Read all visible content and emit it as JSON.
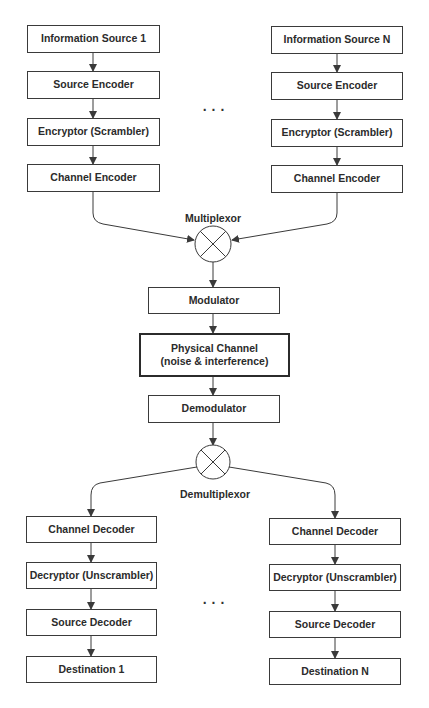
{
  "diagram": {
    "transmitter_left": [
      "Information Source 1",
      "Source Encoder",
      "Encryptor (Scrambler)",
      "Channel Encoder"
    ],
    "transmitter_right": [
      "Information Source N",
      "Source Encoder",
      "Encryptor (Scrambler)",
      "Channel Encoder"
    ],
    "ellipsis": "...",
    "multiplexor_label": "Multiplexor",
    "center": {
      "modulator": "Modulator",
      "channel_line1": "Physical Channel",
      "channel_line2": "(noise & interference)",
      "demodulator": "Demodulator"
    },
    "demultiplexor_label": "Demultiplexor",
    "receiver_left": [
      "Channel Decoder",
      "Decryptor (Unscrambler)",
      "Source Decoder",
      "Destination 1"
    ],
    "receiver_right": [
      "Channel Decoder",
      "Decryptor (Unscrambler)",
      "Source Decoder",
      "Destination N"
    ],
    "colors": {
      "stroke": "#3a3a3a",
      "text": "#2b2b2b",
      "background": "#ffffff"
    }
  }
}
